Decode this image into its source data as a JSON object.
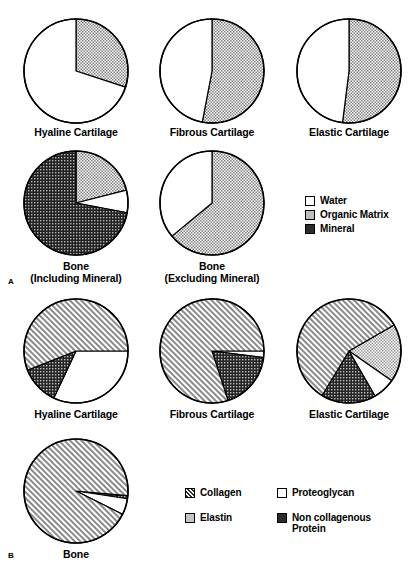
{
  "figure": {
    "panel_a_letter": "A",
    "panel_b_letter": "B"
  },
  "colors": {
    "outline": "#000000",
    "white": "#ffffff",
    "light_gray": "#c9c9c9",
    "mid_gray": "#b0b0b0",
    "dark": "#3a3a3a"
  },
  "panel_a": {
    "charts": [
      {
        "label": "Hyaline Cartilage",
        "slices": [
          {
            "name": "Organic Matrix",
            "value": 30,
            "fill": "organic"
          },
          {
            "name": "Water",
            "value": 70,
            "fill": "water"
          }
        ]
      },
      {
        "label": "Fibrous Cartilage",
        "slices": [
          {
            "name": "Organic Matrix",
            "value": 53,
            "fill": "organic"
          },
          {
            "name": "Water",
            "value": 47,
            "fill": "water"
          }
        ]
      },
      {
        "label": "Elastic Cartilage",
        "slices": [
          {
            "name": "Organic Matrix",
            "value": 52,
            "fill": "organic"
          },
          {
            "name": "Water",
            "value": 48,
            "fill": "water"
          }
        ]
      },
      {
        "label": "Bone\n(Including Mineral)",
        "slices": [
          {
            "name": "Organic Matrix",
            "value": 21,
            "fill": "organic"
          },
          {
            "name": "Water",
            "value": 7,
            "fill": "water"
          },
          {
            "name": "Mineral",
            "value": 72,
            "fill": "mineral"
          }
        ]
      },
      {
        "label": "Bone\n(Excluding Mineral)",
        "slices": [
          {
            "name": "Organic Matrix",
            "value": 64,
            "fill": "organic"
          },
          {
            "name": "Water",
            "value": 36,
            "fill": "water"
          }
        ]
      }
    ],
    "legend": [
      {
        "label": "Water",
        "fill": "water"
      },
      {
        "label": "Organic Matrix",
        "fill": "organic"
      },
      {
        "label": "Mineral",
        "fill": "mineral"
      }
    ]
  },
  "panel_b": {
    "charts": [
      {
        "label": "Hyaline Cartilage",
        "slices": [
          {
            "name": "Proteoglycan",
            "value": 32,
            "fill": "proteoglycan"
          },
          {
            "name": "Non collagenous Protein",
            "value": 12,
            "fill": "noncollagenous"
          },
          {
            "name": "Collagen",
            "value": 56,
            "fill": "collagen"
          }
        ]
      },
      {
        "label": "Fibrous Cartilage",
        "slices": [
          {
            "name": "Proteoglycan",
            "value": 2,
            "fill": "proteoglycan"
          },
          {
            "name": "Non collagenous Protein",
            "value": 18,
            "fill": "noncollagenous"
          },
          {
            "name": "Collagen",
            "value": 80,
            "fill": "collagen"
          }
        ]
      },
      {
        "label": "Elastic Cartilage",
        "slices": [
          {
            "name": "Elastin",
            "value": 18,
            "fill": "elastin"
          },
          {
            "name": "Proteoglycan",
            "value": 7,
            "fill": "proteoglycan"
          },
          {
            "name": "Non collagenous Protein",
            "value": 17,
            "fill": "noncollagenous"
          },
          {
            "name": "Collagen",
            "value": 58,
            "fill": "collagen"
          }
        ]
      },
      {
        "label": "Bone",
        "slices": [
          {
            "name": "Non collagenous Protein",
            "value": 1,
            "fill": "noncollagenous"
          },
          {
            "name": "Proteoglycan",
            "value": 5,
            "fill": "proteoglycan"
          },
          {
            "name": "Collagen",
            "value": 94,
            "fill": "collagen"
          }
        ]
      }
    ],
    "legend": [
      {
        "label": "Collagen",
        "fill": "collagen"
      },
      {
        "label": "Proteoglycan",
        "fill": "proteoglycan"
      },
      {
        "label": "Elastin",
        "fill": "elastin"
      },
      {
        "label": "Non collagenous\nProtein",
        "fill": "noncollagenous"
      }
    ]
  },
  "chart_data": {
    "type": "pie",
    "title": "",
    "panels": [
      {
        "panel": "A",
        "legend_entries": [
          "Water",
          "Organic Matrix",
          "Mineral"
        ],
        "charts": [
          {
            "title": "Hyaline Cartilage",
            "categories": [
              "Organic Matrix",
              "Water"
            ],
            "values": [
              30,
              70
            ],
            "start_angle_deg": 0
          },
          {
            "title": "Fibrous Cartilage",
            "categories": [
              "Organic Matrix",
              "Water"
            ],
            "values": [
              53,
              47
            ],
            "start_angle_deg": 0
          },
          {
            "title": "Elastic Cartilage",
            "categories": [
              "Organic Matrix",
              "Water"
            ],
            "values": [
              52,
              48
            ],
            "start_angle_deg": 0
          },
          {
            "title": "Bone (Including Mineral)",
            "categories": [
              "Organic Matrix",
              "Water",
              "Mineral"
            ],
            "values": [
              21,
              7,
              72
            ],
            "start_angle_deg": 0
          },
          {
            "title": "Bone (Excluding Mineral)",
            "categories": [
              "Organic Matrix",
              "Water"
            ],
            "values": [
              64,
              36
            ],
            "start_angle_deg": 0
          }
        ]
      },
      {
        "panel": "B",
        "legend_entries": [
          "Collagen",
          "Proteoglycan",
          "Elastin",
          "Non collagenous Protein"
        ],
        "charts": [
          {
            "title": "Hyaline Cartilage",
            "categories": [
              "Proteoglycan",
              "Non collagenous Protein",
              "Collagen"
            ],
            "values": [
              32,
              12,
              56
            ],
            "start_angle_deg": 90
          },
          {
            "title": "Fibrous Cartilage",
            "categories": [
              "Proteoglycan",
              "Non collagenous Protein",
              "Collagen"
            ],
            "values": [
              2,
              18,
              80
            ],
            "start_angle_deg": 90
          },
          {
            "title": "Elastic Cartilage",
            "categories": [
              "Elastin",
              "Proteoglycan",
              "Non collagenous Protein",
              "Collagen"
            ],
            "values": [
              18,
              7,
              17,
              58
            ],
            "start_angle_deg": 60
          },
          {
            "title": "Bone",
            "categories": [
              "Non collagenous Protein",
              "Proteoglycan",
              "Collagen"
            ],
            "values": [
              1,
              5,
              94
            ],
            "start_angle_deg": 95
          }
        ]
      }
    ],
    "units": "percent"
  }
}
